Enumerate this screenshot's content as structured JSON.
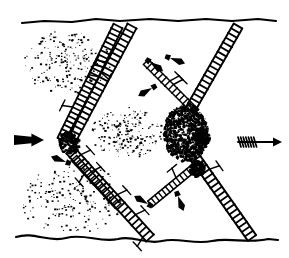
{
  "figure": {
    "title": "Schematic line drawing of fibrous structures spanning a bounded zone",
    "medium": "black ink line art on white ground",
    "background_color": "#ffffff",
    "ink_color": "#000000",
    "width_px": 289,
    "height_px": 258,
    "caption": "",
    "labels": [],
    "annotations": []
  },
  "boundaries": {
    "top_border": {
      "name": "upper boundary line",
      "description": "near-horizontal slightly irregular ink line",
      "path": "M22,23 L44,21 L72,22 L96,19 L120,21 L150,19 L178,21 L206,19 L232,21 L258,19 L276,21",
      "stroke_width": 2.2
    },
    "bottom_border": {
      "name": "lower boundary line",
      "description": "wavy irregular ink line",
      "path": "M16,237 C34,231 48,243 66,238 C84,233 100,243 118,239 C134,235 146,245 162,241 C178,237 194,245 212,241 C230,237 248,244 268,239 L278,240",
      "stroke_width": 2.2
    }
  },
  "arrows": {
    "left_flow_arrow": {
      "name": "solid block arrow, left margin",
      "direction": "right",
      "style": "solid filled tapered block with arrowhead",
      "x": 14,
      "y": 140,
      "length": 30
    },
    "right_flow_arrow": {
      "name": "barbed arrow, right margin",
      "direction": "right",
      "style": "thin shaft with hatched feathered tail and solid arrowhead",
      "x": 238,
      "y": 142,
      "length": 44
    },
    "interior_markers": [
      {
        "name": "drift marker upper centre",
        "x": 150,
        "y": 62,
        "angle": 35
      },
      {
        "name": "drift marker upper right",
        "x": 170,
        "y": 58,
        "angle": 20
      },
      {
        "name": "drift marker mid left",
        "x": 66,
        "y": 162,
        "angle": 200
      },
      {
        "name": "drift marker mid centre",
        "x": 152,
        "y": 88,
        "angle": 150
      },
      {
        "name": "drift marker lower centre",
        "x": 178,
        "y": 196,
        "angle": 70
      },
      {
        "name": "drift marker lower left",
        "x": 148,
        "y": 204,
        "angle": 210
      }
    ]
  },
  "fibres": {
    "description": "elongated ladder-hatched filaments crossing the field diagonally, each with cross-rungs and small lateral branch spurs",
    "items": [
      {
        "name": "fibre A upper left descending",
        "x1": 118,
        "y1": 26,
        "x2": 62,
        "y2": 140,
        "rungs": 26,
        "weight": "heavy"
      },
      {
        "name": "fibre B upper left inner",
        "x1": 132,
        "y1": 26,
        "x2": 70,
        "y2": 142,
        "rungs": 24,
        "weight": "heavy"
      },
      {
        "name": "fibre C lower left descending",
        "x1": 70,
        "y1": 150,
        "x2": 150,
        "y2": 238,
        "rungs": 22,
        "weight": "heavy"
      },
      {
        "name": "fibre D upper right descending",
        "x1": 238,
        "y1": 26,
        "x2": 190,
        "y2": 110,
        "rungs": 18,
        "weight": "heavy"
      },
      {
        "name": "fibre E lower right descending",
        "x1": 190,
        "y1": 150,
        "x2": 252,
        "y2": 238,
        "rungs": 20,
        "weight": "heavy"
      },
      {
        "name": "spindle F mid right",
        "x1": 146,
        "y1": 62,
        "x2": 196,
        "y2": 112,
        "rungs": 14,
        "weight": "medium"
      },
      {
        "name": "spindle G lower mid",
        "x1": 150,
        "y1": 204,
        "x2": 196,
        "y2": 166,
        "rungs": 13,
        "weight": "medium"
      },
      {
        "name": "spindle H lower left",
        "x1": 74,
        "y1": 158,
        "x2": 118,
        "y2": 206,
        "rungs": 12,
        "weight": "medium"
      }
    ]
  },
  "textures": {
    "stipple_clouds": [
      {
        "name": "stipple cloud upper left",
        "cx": 66,
        "cy": 62,
        "rx": 44,
        "ry": 32,
        "density": "graded, dense at top"
      },
      {
        "name": "stipple cloud lower left",
        "cx": 70,
        "cy": 198,
        "rx": 52,
        "ry": 36,
        "density": "dense"
      },
      {
        "name": "stipple cloud centre",
        "cx": 126,
        "cy": 132,
        "rx": 36,
        "ry": 26,
        "density": "moderate"
      }
    ],
    "granular_mass": {
      "name": "dense granular blob, centre right",
      "cx": 186,
      "cy": 132,
      "rx": 22,
      "ry": 28,
      "description": "heavily mottled clot of ink grains"
    }
  },
  "nodes": [
    {
      "name": "junction node left",
      "cx": 68,
      "cy": 142,
      "r": 10
    },
    {
      "name": "junction node centre right",
      "cx": 200,
      "cy": 136,
      "r": 8
    },
    {
      "name": "junction node lower right",
      "cx": 196,
      "cy": 168,
      "r": 7
    }
  ]
}
